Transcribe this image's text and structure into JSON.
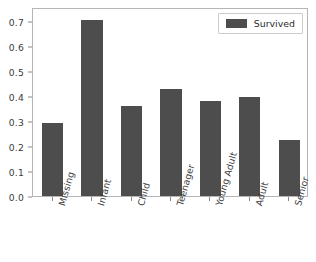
{
  "chart_data": {
    "type": "bar",
    "title": "",
    "xlabel": "",
    "ylabel": "",
    "categories": [
      "Missing",
      "Infant",
      "Child",
      "Teenager",
      "Young Adult",
      "Adult",
      "Senior"
    ],
    "series": [
      {
        "name": "Survived",
        "color": "#4d4d4d",
        "values": [
          0.293,
          0.705,
          0.362,
          0.428,
          0.381,
          0.398,
          0.226
        ]
      }
    ],
    "ylim": [
      0.0,
      0.756
    ],
    "ytick_labels": [
      "0.0",
      "0.1",
      "0.2",
      "0.3",
      "0.4",
      "0.5",
      "0.6",
      "0.7"
    ],
    "ytick_values": [
      0.0,
      0.1,
      0.2,
      0.3,
      0.4,
      0.5,
      0.6,
      0.7
    ],
    "grid": false,
    "legend_position": "upper right",
    "legend_entries": [
      "Survived"
    ],
    "xtick_rotation": -74
  },
  "legend": {
    "label": "Survived",
    "swatch_color": "#4d4d4d"
  },
  "axes": {
    "spine_color": "#b5b5b5",
    "tick_color": "#888888",
    "label_color": "#3a3a3a",
    "background": "#ffffff"
  }
}
